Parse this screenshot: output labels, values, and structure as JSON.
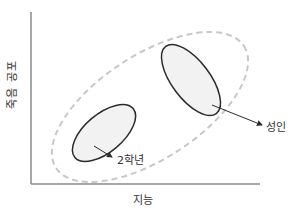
{
  "diagram": {
    "x_axis_label": "지능",
    "y_axis_label": "죽음 공포",
    "groups": [
      {
        "name": "2학년",
        "label": "2학년",
        "region": "lower-left, small ellipse"
      },
      {
        "name": "성인",
        "label": "성인",
        "region": "upper-right, small ellipse"
      }
    ],
    "outer_region": {
      "style": "dashed",
      "description": "enclosing dashed ellipse spanning both groups"
    },
    "colors": {
      "axis": "#8a8a8a",
      "ellipse_stroke": "#2b2b2b",
      "ellipse_fill": "#f2f2f2",
      "dashed_outline": "#c8c8c8",
      "text": "#333333"
    }
  }
}
